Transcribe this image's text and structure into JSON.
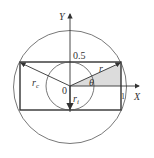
{
  "diagram": {
    "axes": {
      "x_label": "X",
      "y_label": "Y"
    },
    "labels": {
      "origin": "0",
      "half": "0.5",
      "one": "1",
      "r_c": "r",
      "r_c_sub": "c",
      "r_i": "r",
      "r_i_sub": "i",
      "r": "r",
      "theta": "θ"
    },
    "colors": {
      "line": "#444444",
      "shade": "#d9d9d9"
    }
  }
}
